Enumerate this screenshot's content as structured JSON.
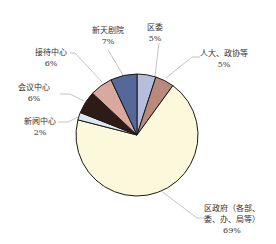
{
  "chart_data": {
    "type": "pie",
    "title": "",
    "start_angle": "12 o'clock, clockwise",
    "slices": [
      {
        "label": "区委",
        "value": 5,
        "value_label": "5%",
        "color": "#b7bedc"
      },
      {
        "label": "人大、政协等",
        "value": 5,
        "value_label": "5%",
        "color": "#b98a7c"
      },
      {
        "label": "区政府（各部、委、办、局等）",
        "value": 69,
        "value_label": "69%",
        "color": "#fbf8dc"
      },
      {
        "label": "新闻中心",
        "value": 2,
        "value_label": "2%",
        "color": "#dce8f0"
      },
      {
        "label": "会议中心",
        "value": 6,
        "value_label": "6%",
        "color": "#2e1b16"
      },
      {
        "label": "接待中心",
        "value": 6,
        "value_label": "6%",
        "color": "#d9a9a0"
      },
      {
        "label": "新天剧院",
        "value": 7,
        "value_label": "7%",
        "color": "#56689a"
      }
    ],
    "legend": "none (leader-line labels)"
  },
  "labels": {
    "quwei": {
      "name": "区委",
      "pct": "5%"
    },
    "renda": {
      "name": "人大、政协等",
      "pct": "5%"
    },
    "quzhengfu": {
      "line1": "区政府（各部、",
      "line2": "委、办、局等）",
      "pct": "69%"
    },
    "xinwen": {
      "name": "新闻中心",
      "pct": "2%"
    },
    "huiyi": {
      "name": "会议中心",
      "pct": "6%"
    },
    "jiedai": {
      "name": "接待中心",
      "pct": "6%"
    },
    "juyuan": {
      "name": "新天剧院",
      "pct": "7%"
    }
  }
}
